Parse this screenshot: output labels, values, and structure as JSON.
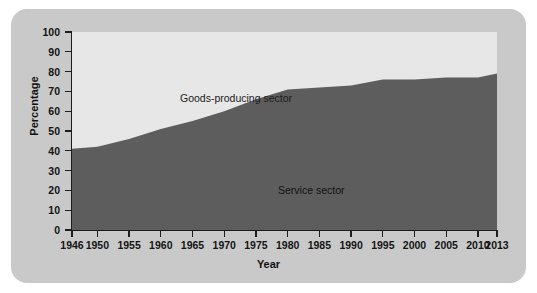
{
  "chart_data": {
    "type": "area",
    "title": "",
    "xlabel": "Year",
    "ylabel": "Percentage",
    "xlim": [
      1946,
      2013
    ],
    "ylim": [
      0,
      100
    ],
    "grid": false,
    "legend_position": "inline-annotations",
    "stacked": true,
    "x_tick_labels": [
      "1946",
      "1950",
      "1955",
      "1960",
      "1965",
      "1970",
      "1975",
      "1980",
      "1985",
      "1990",
      "1995",
      "2000",
      "2005",
      "2010",
      "2013"
    ],
    "x_ticks": [
      1946,
      1950,
      1955,
      1960,
      1965,
      1970,
      1975,
      1980,
      1985,
      1990,
      1995,
      2000,
      2005,
      2010,
      2013
    ],
    "y_tick_labels": [
      "0",
      "10",
      "20",
      "30",
      "40",
      "50",
      "60",
      "70",
      "80",
      "90",
      "100"
    ],
    "y_ticks": [
      0,
      10,
      20,
      30,
      40,
      50,
      60,
      70,
      80,
      90,
      100
    ],
    "series": [
      {
        "name": "Service sector",
        "color": "#5d5d5d",
        "x": [
          1946,
          1950,
          1955,
          1960,
          1965,
          1970,
          1975,
          1980,
          1985,
          1990,
          1995,
          2000,
          2005,
          2010,
          2013
        ],
        "values": [
          41,
          42,
          46,
          51,
          55,
          60,
          66,
          71,
          72,
          73,
          76,
          76,
          77,
          77,
          79
        ]
      },
      {
        "name": "Goods-producing sector",
        "color": "#e7e7e7",
        "x": [
          1946,
          1950,
          1955,
          1960,
          1965,
          1970,
          1975,
          1980,
          1985,
          1990,
          1995,
          2000,
          2005,
          2010,
          2013
        ],
        "values": [
          59,
          58,
          54,
          49,
          45,
          40,
          34,
          29,
          28,
          27,
          24,
          24,
          23,
          23,
          21
        ]
      }
    ],
    "annotations": [
      {
        "text": "Goods-producing sector",
        "x": 1952,
        "y": 86
      },
      {
        "text": "Service sector",
        "x": 1974,
        "y": 40
      }
    ]
  },
  "colors": {
    "page_background": "#ffffff",
    "card_background": "#c9c9c9",
    "service_sector": "#5d5d5d",
    "goods_sector": "#e7e7e7",
    "axis": "#1d1d1d",
    "text": "#141414"
  }
}
